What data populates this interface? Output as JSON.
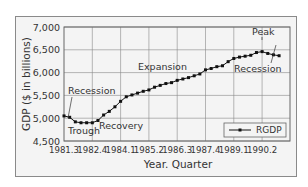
{
  "chart_data": {
    "type": "line",
    "title": "",
    "xlabel": "Year. Quarter",
    "ylabel": "GDP ($ in billions)",
    "ylim": [
      4500,
      7000
    ],
    "yticks": [
      "7,000",
      "6,500",
      "6,000",
      "5,500",
      "5,000",
      "4,500"
    ],
    "xticks": [
      "1981.3",
      "1982.4",
      "1984.1",
      "1985.2",
      "1986.3",
      "1987.4",
      "1989.1",
      "1990.2"
    ],
    "grid": true,
    "legend": {
      "position": "lower right",
      "entries": [
        "RGDP"
      ]
    },
    "annotations": [
      "Recession",
      "Trough",
      "Recovery",
      "Expansion",
      "Peak",
      "Recession"
    ],
    "series": [
      {
        "name": "RGDP",
        "x": [
          "1981.3",
          "1981.4",
          "1982.1",
          "1982.2",
          "1982.3",
          "1982.4",
          "1983.1",
          "1983.2",
          "1983.3",
          "1983.4",
          "1984.1",
          "1984.2",
          "1984.3",
          "1984.4",
          "1985.1",
          "1985.2",
          "1985.3",
          "1985.4",
          "1986.1",
          "1986.2",
          "1986.3",
          "1986.4",
          "1987.1",
          "1987.2",
          "1987.3",
          "1987.4",
          "1988.1",
          "1988.2",
          "1988.3",
          "1988.4",
          "1989.1",
          "1989.2",
          "1989.3",
          "1989.4",
          "1990.1",
          "1990.2",
          "1990.3",
          "1990.4",
          "1991.1"
        ],
        "values": [
          5050,
          5020,
          4920,
          4900,
          4900,
          4900,
          4950,
          5070,
          5150,
          5250,
          5370,
          5470,
          5510,
          5550,
          5590,
          5620,
          5680,
          5720,
          5760,
          5780,
          5830,
          5860,
          5890,
          5930,
          5970,
          6060,
          6090,
          6130,
          6150,
          6240,
          6310,
          6340,
          6360,
          6380,
          6440,
          6460,
          6420,
          6390,
          6370
        ]
      }
    ]
  },
  "labels": {
    "ylabel": "GDP ($ in billions)",
    "xlabel": "Year. Quarter",
    "legend": "RGDP",
    "ann_recession1": "Recession",
    "ann_trough": "Trough",
    "ann_recovery": "Recovery",
    "ann_expansion": "Expansion",
    "ann_peak": "Peak",
    "ann_recession2": "Recession"
  }
}
